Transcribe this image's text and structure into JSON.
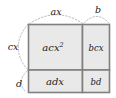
{
  "diagram": {
    "type": "area-model-box-diagram",
    "colors": {
      "cell_fill": "#e9e9e9",
      "cell_border": "#808080",
      "guide_line": "#b8b8b8",
      "text": "#1a1a1a",
      "background": "#ffffff"
    },
    "edge_labels": {
      "top_wide": "ax",
      "top_narrow": "b",
      "left_tall": "cx",
      "left_short": "d"
    },
    "cells": [
      {
        "id": "top-left",
        "base": "acx",
        "exponent": "2",
        "full": "acx²"
      },
      {
        "id": "top-right",
        "base": "bcx",
        "exponent": "",
        "full": "bcx"
      },
      {
        "id": "bottom-left",
        "base": "adx",
        "exponent": "",
        "full": "adx"
      },
      {
        "id": "bottom-right",
        "base": "bd",
        "exponent": "",
        "full": "bd"
      }
    ]
  }
}
